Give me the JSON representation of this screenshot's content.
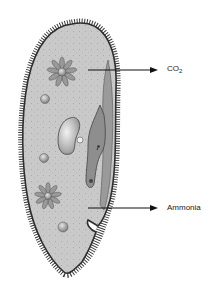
{
  "diagram": {
    "labels": {
      "co2": {
        "base": "CO",
        "sub": "2"
      },
      "ammonia": "Ammonia"
    },
    "colors": {
      "cytoplasm": "#c8c8c8",
      "outline": "#3a3a3a",
      "oral_groove": "#8f8f8f",
      "nucleus": "#a9a9a9",
      "arrow": "#111111",
      "background": "#ffffff"
    }
  }
}
